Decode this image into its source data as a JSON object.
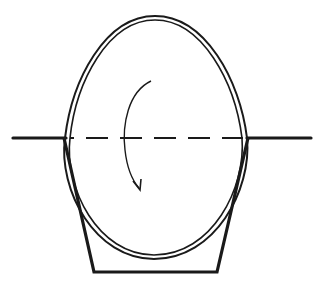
{
  "diagram": {
    "colors": {
      "stroke": "#1a1a1a",
      "background": "#ffffff"
    },
    "elements": {
      "horizontal_line": {
        "style": "solid-with-dashed-center"
      },
      "egg_outline": {
        "style": "double-line"
      },
      "cup": {
        "shape": "trapezoid-open-top"
      },
      "rotation_arrow": {
        "direction": "clockwise-downward"
      }
    }
  }
}
